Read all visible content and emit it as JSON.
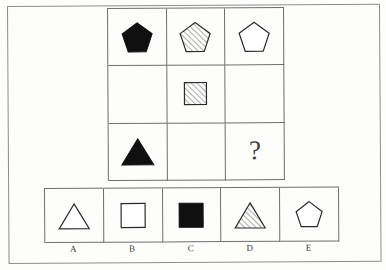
{
  "puzzle": {
    "type": "matrix-reasoning",
    "title": "Figure matrix puzzle",
    "matrix": {
      "rows": 3,
      "columns": 3,
      "cells": [
        {
          "id": "r1c1",
          "shape": "pentagon",
          "fill": "solid-black",
          "label": "black pentagon"
        },
        {
          "id": "r1c2",
          "shape": "pentagon",
          "fill": "hatched",
          "label": "hatched pentagon"
        },
        {
          "id": "r1c3",
          "shape": "pentagon",
          "fill": "white",
          "label": "white pentagon"
        },
        {
          "id": "r2c1",
          "shape": "none",
          "fill": "none",
          "label": "empty"
        },
        {
          "id": "r2c2",
          "shape": "square",
          "fill": "hatched",
          "label": "hatched square"
        },
        {
          "id": "r2c3",
          "shape": "none",
          "fill": "none",
          "label": "empty"
        },
        {
          "id": "r3c1",
          "shape": "triangle",
          "fill": "solid-black",
          "label": "black triangle"
        },
        {
          "id": "r3c2",
          "shape": "none",
          "fill": "none",
          "label": "empty"
        },
        {
          "id": "r3c3",
          "shape": "question",
          "fill": "none",
          "label": "?"
        }
      ]
    },
    "question_mark": "?",
    "options": [
      {
        "key": "A",
        "shape": "triangle",
        "fill": "white",
        "label": "A"
      },
      {
        "key": "B",
        "shape": "square",
        "fill": "white",
        "label": "B"
      },
      {
        "key": "C",
        "shape": "square",
        "fill": "solid-black",
        "label": "C"
      },
      {
        "key": "D",
        "shape": "triangle",
        "fill": "hatched",
        "label": "D"
      },
      {
        "key": "E",
        "shape": "pentagon",
        "fill": "white",
        "label": "E"
      }
    ],
    "colors": {
      "solid_fill": "#101010",
      "outline": "#2b2b2b",
      "hatch_line": "#7a7a7a",
      "grid_line": "#6f6f6f",
      "frame_line": "#8d8d8d",
      "background": "#fdfdfc"
    }
  }
}
